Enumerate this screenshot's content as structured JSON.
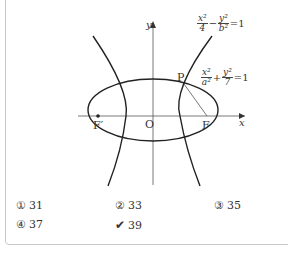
{
  "figure": {
    "axis_labels": {
      "x": "x",
      "y": "y"
    },
    "points": {
      "P": "P",
      "O": "O",
      "F": "F",
      "F_prime": "F′"
    },
    "hyperbola_eq": {
      "x_num": "x²",
      "x_den": "4",
      "op": "−",
      "y_num": "y²",
      "y_den": "b²",
      "rhs": "=1"
    },
    "ellipse_eq": {
      "x_num": "x²",
      "x_den": "a²",
      "op": "+",
      "y_num": "y²",
      "y_den": "7",
      "rhs": "=1"
    }
  },
  "choices": [
    {
      "marker": "①",
      "value": "31"
    },
    {
      "marker": "②",
      "value": "33"
    },
    {
      "marker": "③",
      "value": "35"
    },
    {
      "marker": "④",
      "value": "37"
    },
    {
      "marker": "✔",
      "value": "39",
      "selected": true
    }
  ],
  "colors": {
    "border": "#c8c8c8",
    "ink": "#222222"
  }
}
